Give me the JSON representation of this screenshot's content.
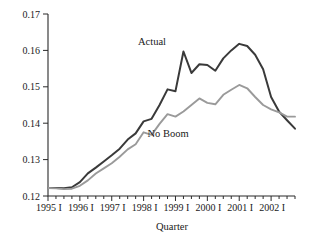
{
  "chart_data": {
    "type": "line",
    "title": "",
    "xlabel": "Quarter",
    "ylabel": "",
    "ylim": [
      0.12,
      0.17
    ],
    "yticks": [
      0.12,
      0.13,
      0.14,
      0.15,
      0.16,
      0.17
    ],
    "ytick_labels": [
      "0.12",
      "0.13",
      "0.14",
      "0.15",
      "0.16",
      "0.17"
    ],
    "grid": false,
    "legend_position": "inline-annotations",
    "x_major_labels": [
      "1995 I",
      "1996 I",
      "1997 I",
      "1998 I",
      "1999 I",
      "2000 I",
      "2001 I",
      "2002 I"
    ],
    "x": [
      "1995 I",
      "1995 II",
      "1995 III",
      "1995 IV",
      "1996 I",
      "1996 II",
      "1996 III",
      "1996 IV",
      "1997 I",
      "1997 II",
      "1997 III",
      "1997 IV",
      "1998 I",
      "1998 II",
      "1998 III",
      "1998 IV",
      "1999 I",
      "1999 II",
      "1999 III",
      "1999 IV",
      "2000 I",
      "2000 II",
      "2000 III",
      "2000 IV",
      "2001 I",
      "2001 II",
      "2001 III",
      "2001 IV",
      "2002 I",
      "2002 II",
      "2002 III",
      "2002 IV"
    ],
    "series": [
      {
        "name": "Actual",
        "color": "#3a3a3a",
        "values": [
          0.1222,
          0.1222,
          0.1221,
          0.1224,
          0.1238,
          0.1262,
          0.1278,
          0.1295,
          0.1312,
          0.133,
          0.1355,
          0.1372,
          0.1405,
          0.1412,
          0.145,
          0.1493,
          0.1488,
          0.1597,
          0.1538,
          0.1562,
          0.156,
          0.1544,
          0.1578,
          0.16,
          0.1618,
          0.1612,
          0.1588,
          0.1548,
          0.1472,
          0.1432,
          0.1408,
          0.1385
        ]
      },
      {
        "name": "No Boom",
        "color": "#9a9a9a",
        "values": [
          0.1222,
          0.1221,
          0.1219,
          0.122,
          0.1228,
          0.1243,
          0.1262,
          0.1276,
          0.129,
          0.1308,
          0.1328,
          0.1342,
          0.1375,
          0.1368,
          0.1398,
          0.1425,
          0.1418,
          0.1432,
          0.145,
          0.1468,
          0.1456,
          0.1452,
          0.1478,
          0.1492,
          0.1505,
          0.1496,
          0.1472,
          0.145,
          0.1438,
          0.143,
          0.1418,
          0.1418
        ]
      }
    ],
    "annotations": [
      {
        "text": "Actual",
        "series": "Actual"
      },
      {
        "text": "No Boom",
        "series": "No Boom"
      }
    ]
  }
}
